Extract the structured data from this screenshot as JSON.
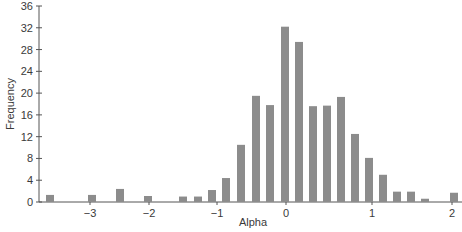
{
  "chart_data": {
    "type": "bar",
    "title": "",
    "xlabel": "Alpha",
    "ylabel": "Frequency",
    "ylim": [
      0,
      36
    ],
    "yticks": [
      0,
      4,
      8,
      12,
      16,
      20,
      24,
      28,
      32,
      36
    ],
    "xticks": [
      "−3",
      "−2",
      "−1",
      "0",
      "1",
      "2"
    ],
    "grid": false,
    "legend": null,
    "bar_color": "#8c8c8c",
    "bars": [
      {
        "x": -3.55,
        "value": 1.3
      },
      {
        "x": -3.0,
        "value": 1.3
      },
      {
        "x": -2.55,
        "value": 2.4
      },
      {
        "x": -2.05,
        "value": 1.1
      },
      {
        "x": -1.4,
        "value": 1.0
      },
      {
        "x": -1.2,
        "value": 1.0
      },
      {
        "x": -1.0,
        "value": 2.2
      },
      {
        "x": -0.8,
        "value": 4.4
      },
      {
        "x": -0.6,
        "value": 10.5
      },
      {
        "x": -0.4,
        "value": 19.5
      },
      {
        "x": -0.2,
        "value": 17.8
      },
      {
        "x": 0.0,
        "value": 32.2
      },
      {
        "x": 0.15,
        "value": 29.4
      },
      {
        "x": 0.3,
        "value": 17.6
      },
      {
        "x": 0.45,
        "value": 17.7
      },
      {
        "x": 0.6,
        "value": 19.3
      },
      {
        "x": 0.75,
        "value": 12.5
      },
      {
        "x": 0.9,
        "value": 8.1
      },
      {
        "x": 1.05,
        "value": 5.0
      },
      {
        "x": 1.2,
        "value": 1.9
      },
      {
        "x": 1.35,
        "value": 1.9
      },
      {
        "x": 1.5,
        "value": 0.6
      },
      {
        "x": 1.95,
        "value": 1.7
      }
    ]
  },
  "layout": {
    "plot_left": 39,
    "plot_right": 462,
    "y_zero_px": 202,
    "y_top_px": 6,
    "xtick_px": [
      90,
      149,
      217,
      286,
      372,
      452
    ],
    "bar_px": [
      50,
      92,
      120,
      148,
      183,
      198,
      212,
      226,
      241,
      256,
      270,
      285,
      299,
      313,
      327,
      341,
      355,
      369,
      383,
      397,
      411,
      425,
      454
    ],
    "bar_width": 8
  }
}
